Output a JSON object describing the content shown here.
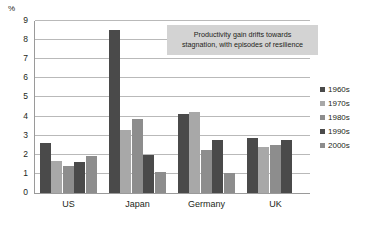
{
  "chart_data": {
    "type": "bar",
    "title": "",
    "subtitle": "",
    "xlabel": "",
    "ylabel": "%",
    "ylim": [
      0,
      9
    ],
    "ytick_values": [
      0,
      1,
      2,
      3,
      4,
      5,
      6,
      7,
      8,
      9
    ],
    "ytick_labels": [
      "0",
      "1",
      "2",
      "3",
      "4",
      "5",
      "6",
      "7",
      "8",
      "9"
    ],
    "grid": true,
    "grid_axis": "y",
    "legend_position": "right",
    "categories": [
      "US",
      "Japan",
      "Germany",
      "UK"
    ],
    "series": [
      {
        "name": "1960s",
        "color": "#4a4a4a",
        "values": [
          2.6,
          8.55,
          4.15,
          2.9
        ]
      },
      {
        "name": "1970s",
        "color": "#a8a8a8",
        "values": [
          1.65,
          3.3,
          4.25,
          2.4
        ]
      },
      {
        "name": "1980s",
        "color": "#8d8d8d",
        "values": [
          1.4,
          3.85,
          2.25,
          2.5
        ]
      },
      {
        "name": "1990s",
        "color": "#4a4a4a",
        "values": [
          1.6,
          2.0,
          2.8,
          2.75
        ]
      },
      {
        "name": "2000s",
        "color": "#8d8d8d",
        "values": [
          1.95,
          1.1,
          1.05,
          0
        ]
      }
    ],
    "annotations": [
      {
        "text": "Productivity gain drifts towards stagnation, with episodes of resilience",
        "line1": "Productivity gain drifts towards",
        "line2": "stagnation, with episodes of resilience",
        "background": "#d3d3d3"
      }
    ]
  },
  "colors": {
    "axis": "#9a9a9a",
    "grid": "#b9b9b9",
    "text": "#231f20",
    "background": "#ffffff",
    "callout_bg": "#d3d3d3"
  }
}
